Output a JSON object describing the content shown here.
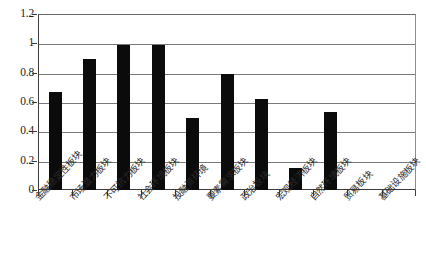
{
  "chart_data": {
    "type": "bar",
    "title": "",
    "subtitle": "",
    "xlabel": "",
    "ylabel": "",
    "ylim": [
      0,
      1.2
    ],
    "ytick_labels": [
      "0",
      "0.2",
      "0.4",
      "0.6",
      "0.8",
      "1",
      "1.2"
    ],
    "ytick_values": [
      0,
      0.2,
      0.4,
      0.6,
      0.8,
      1,
      1.2
    ],
    "grid": "horizontal",
    "legend": "none",
    "bar_color": "#0b0b0b",
    "gridline_color": "#7a7a7a",
    "axis_color": "#3d3d3d",
    "background_color": "#ffffff",
    "categories": [
      "金融稳定性板块",
      "市场潜力板块",
      "不可抗力板块",
      "社会环境板块",
      "投融资环境",
      "要素需求板块",
      "政治板块",
      "宏观经济板块",
      "自然环境板块",
      "贸易板块",
      "基础设施板块"
    ],
    "values": [
      0.67,
      0.89,
      0.99,
      0.99,
      0.49,
      0.79,
      0.62,
      0.15,
      0.53,
      0,
      0
    ]
  }
}
